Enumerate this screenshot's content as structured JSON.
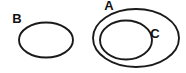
{
  "diagram": {
    "type": "euler-set-diagram",
    "width": 186,
    "height": 73,
    "background_color": "#ffffff",
    "stroke_color": "#1a1a1a",
    "label_color": "#111111",
    "sets": [
      {
        "id": "b",
        "label": "B",
        "shape": "ellipse",
        "cx": 46,
        "cy": 40,
        "rx": 27,
        "ry": 17.5,
        "label_x": 17,
        "label_y": 20,
        "relation": "disjoint from A and C"
      },
      {
        "id": "a",
        "label": "A",
        "shape": "ellipse",
        "cx": 136,
        "cy": 38,
        "rx": 43,
        "ry": 29,
        "label_x": 109,
        "label_y": 7,
        "relation": "contains C"
      },
      {
        "id": "c",
        "label": "C",
        "shape": "ellipse",
        "cx": 126,
        "cy": 40,
        "rx": 26,
        "ry": 19.5,
        "label_x": 155,
        "label_y": 35,
        "relation": "proper subset of A"
      }
    ]
  }
}
